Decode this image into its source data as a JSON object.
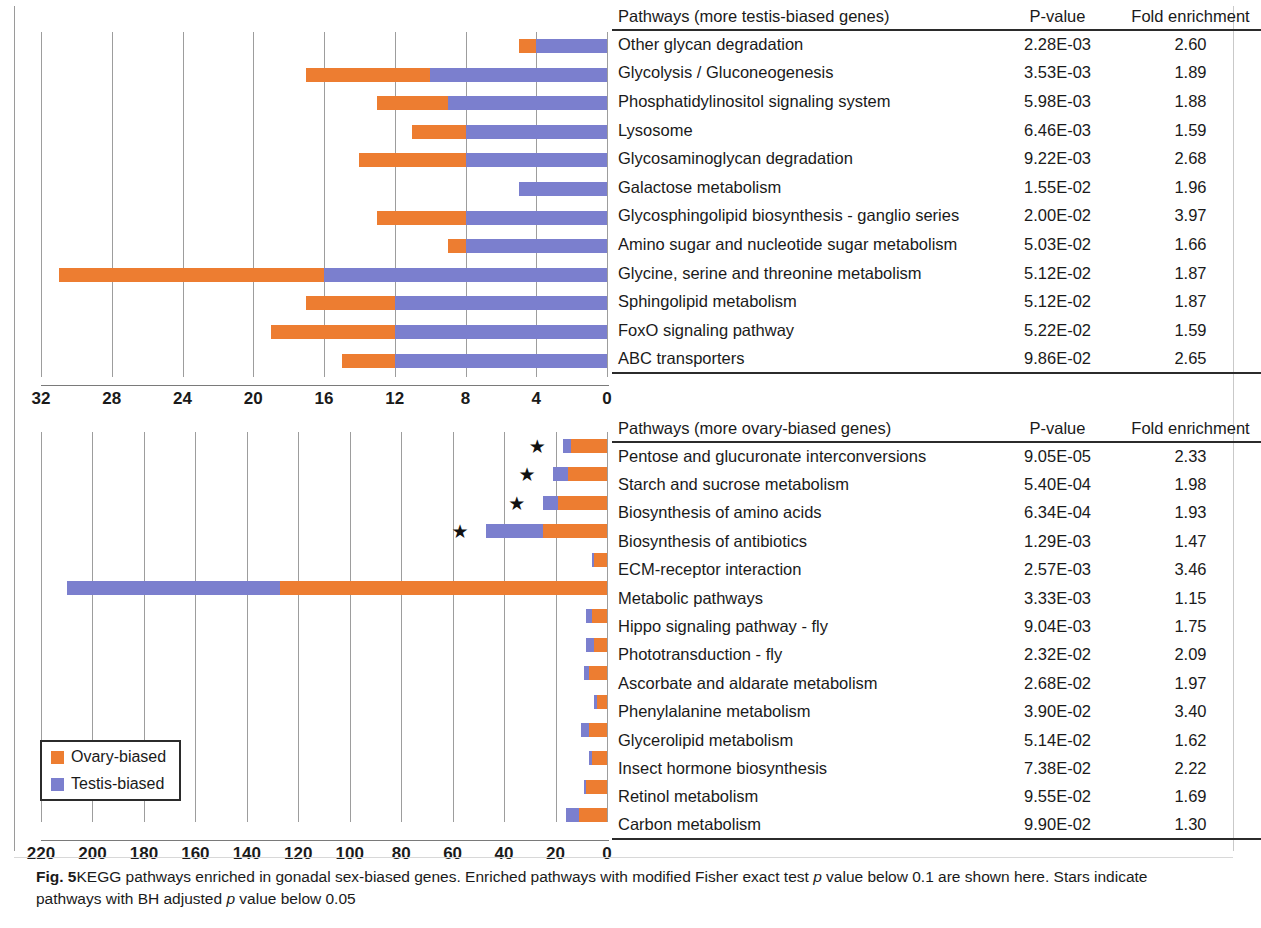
{
  "figure": {
    "label": "Fig. 5",
    "caption": "KEGG pathways enriched in gonadal sex-biased genes. Enriched pathways with modified Fisher exact test p value below 0.1 are shown here. Stars indicate pathways with BH adjusted p value below 0.05",
    "caption_part1": "KEGG pathways enriched in gonadal sex-biased genes. Enriched pathways with modified Fisher exact test ",
    "caption_italic1": "p",
    "caption_part2": " value below 0.1 are shown here. Stars indicate pathways with BH adjusted ",
    "caption_italic2": "p",
    "caption_part3": " value below 0.05"
  },
  "legend": {
    "items": [
      {
        "label": "Ovary-biased",
        "color": "#ed7d31",
        "icon": "orange-square-icon"
      },
      {
        "label": "Testis-biased",
        "color": "#7b7fce",
        "icon": "blue-square-icon"
      }
    ]
  },
  "colors": {
    "ovary": "#ed7d31",
    "testis": "#7b7fce",
    "grid": "#9d9d9d",
    "axis": "#2b2b2b"
  },
  "top_panel": {
    "table": {
      "headers": {
        "pathway": "Pathways (more testis-biased genes)",
        "pvalue": "P-value",
        "fold": "Fold enrichment"
      }
    },
    "axis": {
      "ticks": [
        "32",
        "28",
        "24",
        "20",
        "16",
        "12",
        "8",
        "4",
        "0"
      ],
      "min": 0,
      "max": 32,
      "reversed": true
    }
  },
  "bottom_panel": {
    "table": {
      "headers": {
        "pathway": "Pathways (more ovary-biased genes)",
        "pvalue": "P-value",
        "fold": "Fold enrichment"
      }
    },
    "axis": {
      "ticks": [
        "220",
        "200",
        "180",
        "160",
        "140",
        "120",
        "100",
        "80",
        "60",
        "40",
        "20",
        "0"
      ],
      "min": 0,
      "max": 220,
      "reversed": true
    }
  },
  "chart_data": [
    {
      "type": "bar",
      "orientation": "horizontal-stacked",
      "title": "Pathways (more testis-biased genes)",
      "xlabel": "Number of genes",
      "ylabel": "",
      "xlim": [
        0,
        32
      ],
      "x_axis_reversed": true,
      "grid": true,
      "legend_position": "bottom-left",
      "categories": [
        "Other glycan degradation",
        "Glycolysis / Gluconeogenesis",
        "Phosphatidylinositol signaling system",
        "Lysosome",
        "Glycosaminoglycan degradation",
        "Galactose metabolism",
        "Glycosphingolipid biosynthesis - ganglio series",
        "Amino sugar and nucleotide sugar metabolism",
        "Glycine, serine and threonine metabolism",
        "Sphingolipid metabolism",
        "FoxO signaling pathway",
        "ABC transporters"
      ],
      "series": [
        {
          "name": "Ovary-biased",
          "color": "#ed7d31",
          "values": [
            1,
            7,
            4,
            3,
            6,
            0,
            5,
            1,
            15,
            5,
            7,
            3
          ]
        },
        {
          "name": "Testis-biased",
          "color": "#7b7fce",
          "values": [
            4,
            10,
            9,
            8,
            8,
            5,
            8,
            8,
            16,
            12,
            12,
            12
          ]
        }
      ],
      "pvalues": [
        "2.28E-03",
        "3.53E-03",
        "5.98E-03",
        "6.46E-03",
        "9.22E-03",
        "1.55E-02",
        "2.00E-02",
        "5.03E-02",
        "5.12E-02",
        "5.12E-02",
        "5.22E-02",
        "9.86E-02"
      ],
      "fold_enrichment": [
        "2.60",
        "1.89",
        "1.88",
        "1.59",
        "2.68",
        "1.96",
        "3.97",
        "1.66",
        "1.87",
        "1.87",
        "1.59",
        "2.65"
      ],
      "stars": [
        false,
        false,
        false,
        false,
        false,
        false,
        false,
        false,
        false,
        false,
        false,
        false
      ]
    },
    {
      "type": "bar",
      "orientation": "horizontal-stacked",
      "title": "Pathways (more ovary-biased genes)",
      "xlabel": "Number of genes",
      "ylabel": "",
      "xlim": [
        0,
        220
      ],
      "x_axis_reversed": true,
      "grid": true,
      "legend_position": "bottom-left",
      "categories": [
        "Pentose and glucuronate interconversions",
        "Starch and sucrose metabolism",
        "Biosynthesis of amino acids",
        "Biosynthesis of antibiotics",
        "ECM-receptor interaction",
        "Metabolic pathways",
        "Hippo signaling pathway - fly",
        "Phototransduction - fly",
        "Ascorbate and aldarate metabolism",
        "Phenylalanine metabolism",
        "Glycerolipid metabolism",
        "Insect hormone biosynthesis",
        "Retinol metabolism",
        "Carbon metabolism"
      ],
      "series": [
        {
          "name": "Ovary-biased",
          "color": "#ed7d31",
          "values": [
            14,
            15,
            19,
            25,
            5,
            127,
            6,
            5,
            7,
            4,
            7,
            6,
            8,
            11
          ]
        },
        {
          "name": "Testis-biased",
          "color": "#7b7fce",
          "values": [
            3,
            6,
            6,
            22,
            1,
            83,
            2,
            3,
            2,
            1,
            3,
            1,
            1,
            5
          ]
        }
      ],
      "pvalues": [
        "9.05E-05",
        "5.40E-04",
        "6.34E-04",
        "1.29E-03",
        "2.57E-03",
        "3.33E-03",
        "9.04E-03",
        "2.32E-02",
        "2.68E-02",
        "3.90E-02",
        "5.14E-02",
        "7.38E-02",
        "9.55E-02",
        "9.90E-02"
      ],
      "fold_enrichment": [
        "2.33",
        "1.98",
        "1.93",
        "1.47",
        "3.46",
        "1.15",
        "1.75",
        "2.09",
        "1.97",
        "3.40",
        "1.62",
        "2.22",
        "1.69",
        "1.30"
      ],
      "stars": [
        true,
        true,
        true,
        true,
        false,
        false,
        false,
        false,
        false,
        false,
        false,
        false,
        false,
        false
      ]
    }
  ]
}
